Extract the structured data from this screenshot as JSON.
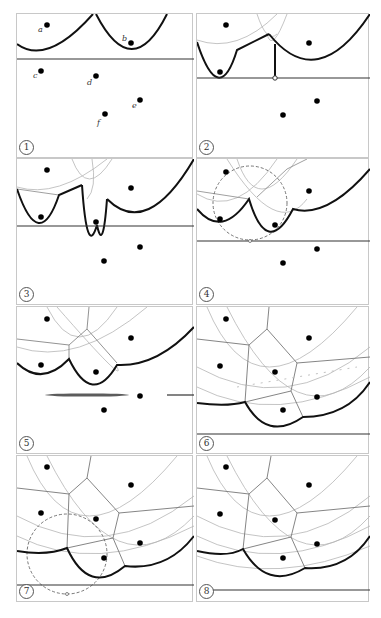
{
  "figure": {
    "point_labels": [
      "a",
      "b",
      "c",
      "d",
      "e",
      "f"
    ],
    "colors": {
      "beach_line": "#111111",
      "sweep_line": "#333333",
      "arcs": "#b5b5b5",
      "voronoi_edges": "#777777",
      "circle_event": "#666666",
      "site": "#000000",
      "panel_border": "#c8c8c8"
    },
    "panels": [
      {
        "step": "1",
        "sweep_y": 45,
        "description": "Sites a and b above the sweep line form parabolic arcs; c, d, e, f not yet processed"
      },
      {
        "step": "2",
        "sweep_y": 64,
        "description": "Site event at c: new arc inserted, vertical edge drawn to sweep line"
      },
      {
        "step": "3",
        "sweep_y": 67,
        "description": "Site event at d: another arc inserted into the beach line"
      },
      {
        "step": "4",
        "sweep_y": 82,
        "description": "Circle event (dashed) detected through three sites"
      },
      {
        "step": "5",
        "sweep_y": 88,
        "description": "Voronoi vertex created; sweep line advances"
      },
      {
        "step": "6",
        "sweep_y": 127,
        "description": "Sites e and f processed; more Voronoi edges traced"
      },
      {
        "step": "7",
        "sweep_y": 129,
        "description": "Another circle event (dashed) near the bottom"
      },
      {
        "step": "8",
        "sweep_y": 134,
        "description": "Final beach line; Voronoi diagram nearly complete"
      }
    ]
  }
}
